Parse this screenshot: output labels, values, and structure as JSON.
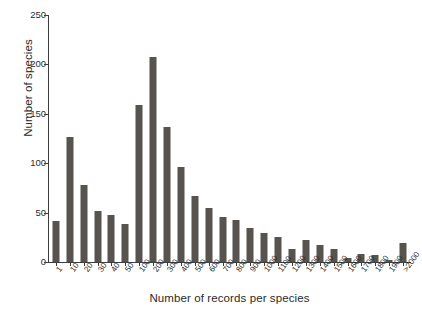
{
  "chart_data": {
    "type": "bar",
    "title": "",
    "subtitle": "",
    "xlabel": "Number of records per species",
    "ylabel": "Number of species",
    "categories": [
      "1",
      "10",
      "20",
      "30",
      "40",
      "50",
      "100",
      "200",
      "300",
      "400",
      "500",
      "600",
      "700",
      "800",
      "900",
      "1000",
      "1100",
      "1200",
      "1300",
      "1400",
      "1500",
      "1600",
      "1700",
      "1800",
      "1900",
      ">2000"
    ],
    "values": [
      42,
      127,
      78,
      52,
      48,
      38,
      159,
      207,
      137,
      96,
      67,
      55,
      46,
      43,
      34,
      29,
      25,
      13,
      22,
      17,
      13,
      4,
      8,
      7,
      2,
      19
    ],
    "ylim": [
      0,
      250
    ],
    "yticks": [
      0,
      50,
      100,
      150,
      200,
      250
    ],
    "ytick_labels": [
      "0",
      "50",
      "100",
      "150",
      "200",
      "250"
    ],
    "grid": false,
    "legend": false,
    "legend_position": "none",
    "bar_color": "#57534f",
    "axis_color": "#3d3d3d",
    "text_color": "#2b2b2b",
    "background_color": "#ffffff"
  }
}
